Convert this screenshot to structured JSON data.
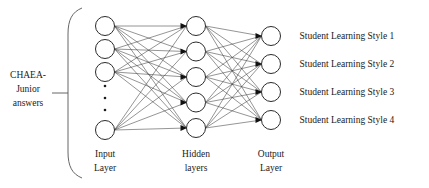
{
  "figure": {
    "width": 429,
    "height": 188,
    "background": "#ffffff",
    "line_color": "#3d3d3d",
    "node_stroke": "#2b2b2b",
    "node_fill": "#ffffff",
    "text_color": "#1a1a1a"
  },
  "input_source": {
    "lines": [
      "CHAEA-",
      "Junior",
      "answers"
    ],
    "line1": "CHAEA-",
    "line2": "Junior",
    "line3": "answers"
  },
  "layers": {
    "input": {
      "caption_line1": "Input",
      "caption_line2": "Layer",
      "visible_node_count": 4,
      "has_ellipsis": true,
      "ellipsis_dots": 3
    },
    "hidden": {
      "caption_line1": "Hidden",
      "caption_line2": "layers",
      "node_count": 5
    },
    "output": {
      "caption_line1": "Output",
      "caption_line2": "Layer",
      "node_count": 4
    }
  },
  "output_labels": [
    "Student Learning Style 1",
    "Student Learning Style 2",
    "Student Learning Style 3",
    "Student Learning Style 4"
  ],
  "chart_data": {
    "type": "diagram",
    "diagram_kind": "feedforward-neural-network",
    "title": "",
    "layer_names": [
      "Input Layer",
      "Hidden layers",
      "Output Layer"
    ],
    "layer_sizes": [
      4,
      5,
      4
    ],
    "input_layer_truncated": true,
    "connections": [
      "input-to-hidden fully connected",
      "hidden-to-output fully connected"
    ],
    "arrow_direction": "left-to-right",
    "input_annotation": "CHAEA-Junior answers",
    "output_annotations": [
      "Student Learning Style 1",
      "Student Learning Style 2",
      "Student Learning Style 3",
      "Student Learning Style 4"
    ],
    "geometry": {
      "node_radius": 9.5,
      "input_x": 105,
      "hidden_x": 196,
      "output_x": 271,
      "input_y": [
        26,
        49,
        72,
        130
      ],
      "hidden_y": [
        26,
        51.5,
        77,
        102.5,
        128
      ],
      "output_y": [
        36,
        64,
        92,
        120
      ],
      "ellipsis_y": [
        86,
        98,
        110
      ]
    }
  }
}
